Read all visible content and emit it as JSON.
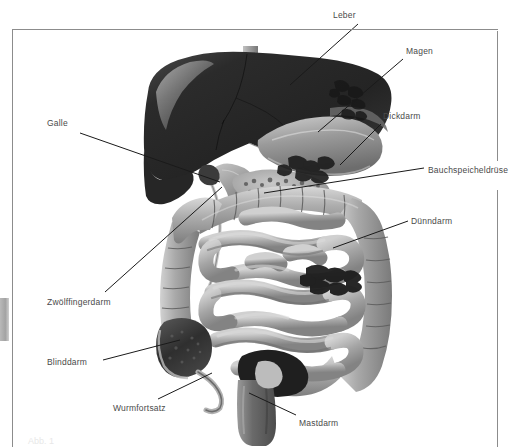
{
  "figure": {
    "kind": "anatomical-diagram",
    "language": "de"
  },
  "labels": [
    {
      "id": "leber",
      "text": "Leber",
      "x": 333,
      "y": 10,
      "leader": {
        "x1": 358,
        "y1": 24,
        "x2": 290,
        "y2": 85
      }
    },
    {
      "id": "magen",
      "text": "Magen",
      "x": 406,
      "y": 46,
      "leader": {
        "x1": 403,
        "y1": 59,
        "x2": 318,
        "y2": 132
      }
    },
    {
      "id": "dickdarm",
      "text": "Dickdarm",
      "x": 383,
      "y": 111,
      "leader": {
        "x1": 381,
        "y1": 124,
        "x2": 340,
        "y2": 165
      }
    },
    {
      "id": "bauchspeicheldruese",
      "text": "Bauchspeicheldrüse",
      "x": 428,
      "y": 165,
      "leader": {
        "x1": 424,
        "y1": 168,
        "x2": 264,
        "y2": 193
      }
    },
    {
      "id": "duenndarm",
      "text": "Dünndarm",
      "x": 411,
      "y": 216,
      "leader": {
        "x1": 408,
        "y1": 221,
        "x2": 333,
        "y2": 248
      }
    },
    {
      "id": "galle",
      "text": "Galle",
      "x": 47,
      "y": 118,
      "leader": {
        "x1": 80,
        "y1": 133,
        "x2": 220,
        "y2": 182
      }
    },
    {
      "id": "zwoelffingerdarm",
      "text": "Zwölffingerdarm",
      "x": 47,
      "y": 297,
      "leader": {
        "x1": 105,
        "y1": 292,
        "x2": 222,
        "y2": 187
      }
    },
    {
      "id": "blinddarm",
      "text": "Blinddarm",
      "x": 47,
      "y": 357,
      "leader": {
        "x1": 103,
        "y1": 360,
        "x2": 180,
        "y2": 340
      }
    },
    {
      "id": "wurmfortsatz",
      "text": "Wurmfortsatz",
      "x": 113,
      "y": 403,
      "leader": {
        "x1": 158,
        "y1": 399,
        "x2": 212,
        "y2": 373
      }
    },
    {
      "id": "mastdarm",
      "text": "Mastdarm",
      "x": 299,
      "y": 418,
      "leader": {
        "x1": 296,
        "y1": 415,
        "x2": 249,
        "y2": 393
      }
    }
  ],
  "colors": {
    "liver": "#2e2e2e",
    "stomach": "#8e8e8e",
    "intestine": "#a8a8a8",
    "intestine_shadow": "#7b7b7b",
    "intestine_highlight": "#d6d6d6",
    "cecum": "#3a3a3a",
    "rectum": "#6f6f6f",
    "leader_line": "#1a1a1a",
    "frame": "#8c8c8c",
    "label_text": "#4a4a4a",
    "background": "#ffffff",
    "edge_tab": "#a3a3a3"
  },
  "caption_ghost": "Abb. 1"
}
